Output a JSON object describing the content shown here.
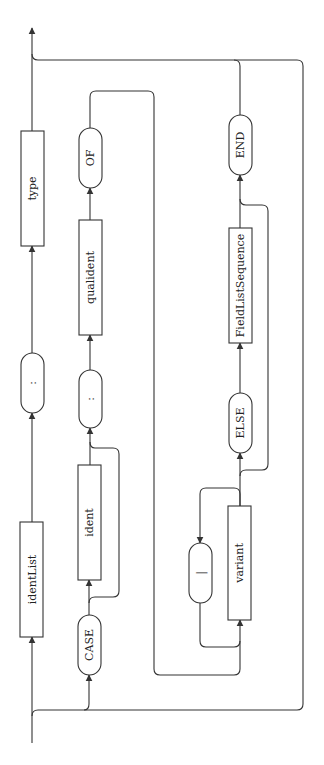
{
  "diagram": {
    "orientation": "rotated-90-ccw",
    "colors": {
      "line": "#333333",
      "background": "#ffffff",
      "text": "#222222"
    },
    "nodes": [
      {
        "id": "identList",
        "kind": "nonterminal",
        "label": "identList",
        "x": 20,
        "y": 522,
        "w": 23,
        "h": 115
      },
      {
        "id": "colon1",
        "kind": "terminal",
        "label": ":",
        "x": 21,
        "y": 353,
        "w": 23,
        "h": 60
      },
      {
        "id": "type",
        "kind": "nonterminal",
        "label": "type",
        "x": 21,
        "y": 131,
        "w": 23,
        "h": 115
      },
      {
        "id": "case",
        "kind": "terminal",
        "label": "CASE",
        "x": 78,
        "y": 615,
        "w": 23,
        "h": 60
      },
      {
        "id": "ident",
        "kind": "nonterminal",
        "label": "ident",
        "x": 78,
        "y": 465,
        "w": 23,
        "h": 115
      },
      {
        "id": "colon2",
        "kind": "terminal",
        "label": ":",
        "x": 79,
        "y": 370,
        "w": 23,
        "h": 58
      },
      {
        "id": "qualident",
        "kind": "nonterminal",
        "label": "qualident",
        "x": 79,
        "y": 220,
        "w": 23,
        "h": 115
      },
      {
        "id": "of",
        "kind": "terminal",
        "label": "OF",
        "x": 79,
        "y": 128,
        "w": 23,
        "h": 60
      },
      {
        "id": "bar",
        "kind": "terminal",
        "label": "|",
        "x": 189,
        "y": 543,
        "w": 23,
        "h": 60
      },
      {
        "id": "variant",
        "kind": "nonterminal",
        "label": "variant",
        "x": 228,
        "y": 506,
        "w": 23,
        "h": 114
      },
      {
        "id": "else",
        "kind": "terminal",
        "label": "ELSE",
        "x": 229,
        "y": 393,
        "w": 23,
        "h": 60
      },
      {
        "id": "fieldListSequence",
        "kind": "nonterminal",
        "label": "FieldListSequence",
        "x": 229,
        "y": 228,
        "w": 23,
        "h": 115
      },
      {
        "id": "end",
        "kind": "terminal",
        "label": "END",
        "x": 229,
        "y": 115,
        "w": 23,
        "h": 60
      }
    ]
  }
}
